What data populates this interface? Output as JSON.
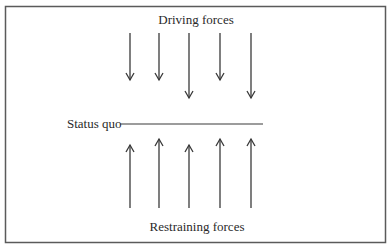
{
  "diagram": {
    "type": "force-field-analysis",
    "top_label": "Driving forces",
    "middle_label": "Status quo",
    "bottom_label": "Restraining forces",
    "driving_forces": [
      {
        "direction": "down",
        "relative_strength": "short"
      },
      {
        "direction": "down",
        "relative_strength": "short"
      },
      {
        "direction": "down",
        "relative_strength": "long"
      },
      {
        "direction": "down",
        "relative_strength": "short"
      },
      {
        "direction": "down",
        "relative_strength": "long"
      }
    ],
    "restraining_forces": [
      {
        "direction": "up",
        "relative_strength": "short"
      },
      {
        "direction": "up",
        "relative_strength": "long"
      },
      {
        "direction": "up",
        "relative_strength": "short"
      },
      {
        "direction": "up",
        "relative_strength": "long"
      },
      {
        "direction": "up",
        "relative_strength": "long"
      }
    ],
    "colors": {
      "stroke": "#3a3a3a",
      "frame": "#5a5a5a",
      "text": "#2a2a2a",
      "background": "#ffffff"
    }
  }
}
